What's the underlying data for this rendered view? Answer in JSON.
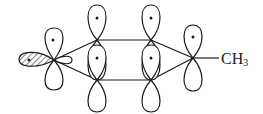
{
  "diagram": {
    "type": "p-orbital overlap diagram",
    "substituent_label": "CH",
    "substituent_subscript": "3",
    "atoms": [
      {
        "id": "C-left",
        "x": 54,
        "y": 60,
        "orbitals": [
          "p-up(dot)",
          "p-down",
          "hatched-sp-left",
          "small-right"
        ]
      },
      {
        "id": "C-top-left",
        "x": 97,
        "y": 40,
        "orbitals": [
          "p-up(dot)",
          "p-down"
        ]
      },
      {
        "id": "C-bottom-left",
        "x": 97,
        "y": 80,
        "orbitals": [
          "p-up(dot)",
          "p-down"
        ]
      },
      {
        "id": "C-top-right",
        "x": 151,
        "y": 40,
        "orbitals": [
          "p-up(dot)",
          "p-down"
        ]
      },
      {
        "id": "C-bottom-right",
        "x": 151,
        "y": 80,
        "orbitals": [
          "p-up(dot)",
          "p-down"
        ]
      },
      {
        "id": "C-right",
        "x": 193,
        "y": 58,
        "orbitals": [
          "p-up(dot)",
          "p-down"
        ]
      }
    ],
    "colors": {
      "stroke": "#1a1a1a",
      "background": "#ffffff"
    }
  }
}
